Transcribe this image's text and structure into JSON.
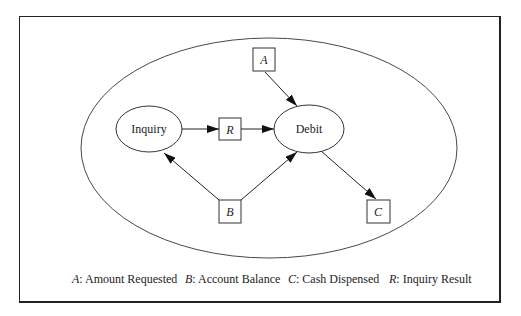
{
  "diagram": {
    "nodes": {
      "inquiry": {
        "label": "Inquiry",
        "shape": "ellipse"
      },
      "debit": {
        "label": "Debit",
        "shape": "ellipse"
      },
      "a": {
        "label": "A",
        "shape": "box"
      },
      "r": {
        "label": "R",
        "shape": "box"
      },
      "b": {
        "label": "B",
        "shape": "box"
      },
      "c": {
        "label": "C",
        "shape": "box"
      }
    },
    "edges": [
      {
        "from": "Inquiry",
        "to": "R"
      },
      {
        "from": "R",
        "to": "Debit"
      },
      {
        "from": "A",
        "to": "Debit"
      },
      {
        "from": "B",
        "to": "Inquiry"
      },
      {
        "from": "B",
        "to": "Debit"
      },
      {
        "from": "Debit",
        "to": "C"
      }
    ]
  },
  "legend": [
    {
      "key": "A",
      "sep": ":",
      "text": " Amount Requested"
    },
    {
      "key": "B",
      "sep": ":",
      "text": " Account Balance"
    },
    {
      "key": "C",
      "sep": ":",
      "text": " Cash Dispensed"
    },
    {
      "key": "R",
      "sep": ":",
      "text": " Inquiry Result"
    }
  ]
}
